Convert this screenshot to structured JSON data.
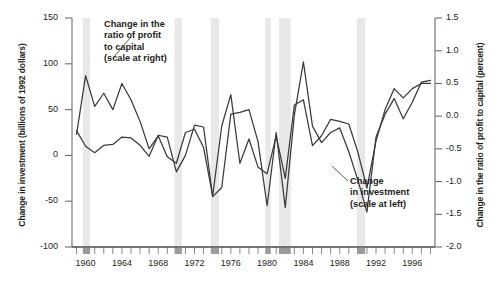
{
  "chart_data": {
    "type": "line",
    "title": "",
    "xlabel": "",
    "ylabel": "Change in investment (billions of 1992 dollars)",
    "y2label": "Change in the ratio of profit to capital (percent)",
    "xlim": [
      1958.5,
      1998.5
    ],
    "ylim": [
      -100,
      150
    ],
    "y2lim": [
      -2.0,
      1.5
    ],
    "grid": false,
    "legend": "annotations-inline",
    "yticks": [
      150,
      100,
      50,
      0,
      -50,
      -100
    ],
    "yticklabels": [
      "150",
      "100",
      "50",
      "0",
      "-50",
      "-100"
    ],
    "y2ticks": [
      1.5,
      1.0,
      0.5,
      0.0,
      -0.5,
      -1.0,
      -1.5,
      -2.0
    ],
    "y2ticklabels": [
      "1.5",
      "1.0",
      "0.5",
      "0.0",
      "-0.5",
      "-1.0",
      "-1.5",
      "-2.0"
    ],
    "xticks": [
      1960,
      1964,
      1968,
      1972,
      1976,
      1980,
      1984,
      1988,
      1992,
      1996
    ],
    "xticklabels": [
      "1960",
      "1964",
      "1968",
      "1972",
      "1976",
      "1980",
      "1984",
      "1988",
      "1992",
      "1996"
    ],
    "xminorticks": [
      1959,
      1960,
      1961,
      1962,
      1963,
      1964,
      1965,
      1966,
      1967,
      1968,
      1969,
      1970,
      1971,
      1972,
      1973,
      1974,
      1975,
      1976,
      1977,
      1978,
      1979,
      1980,
      1981,
      1982,
      1983,
      1984,
      1985,
      1986,
      1987,
      1988,
      1989,
      1990,
      1991,
      1992,
      1993,
      1994,
      1995,
      1996,
      1997,
      1998
    ],
    "x": [
      1959,
      1960,
      1961,
      1962,
      1963,
      1964,
      1965,
      1966,
      1967,
      1968,
      1969,
      1970,
      1971,
      1972,
      1973,
      1974,
      1975,
      1976,
      1977,
      1978,
      1979,
      1980,
      1981,
      1982,
      1983,
      1984,
      1985,
      1986,
      1987,
      1988,
      1989,
      1990,
      1991,
      1992,
      1993,
      1994,
      1995,
      1996,
      1997,
      1998
    ],
    "series": [
      {
        "name": "Change in investment (scale at left)",
        "axis": "left",
        "units": "billions of 1992 dollars",
        "color": "#3a3a3a",
        "values": [
          27,
          10,
          3,
          11,
          12,
          20,
          19,
          11,
          -1,
          22,
          20,
          -18,
          0,
          33,
          31,
          -45,
          -35,
          45,
          47,
          50,
          15,
          -55,
          25,
          -57,
          44,
          102,
          32,
          14,
          25,
          30,
          4,
          -27,
          -62,
          20,
          45,
          62,
          40,
          58,
          80,
          82
        ]
      },
      {
        "name": "Change in the ratio of profit to capital (scale at right)",
        "axis": "right",
        "units": "percent",
        "color": "#3a3a3a",
        "values": [
          -0.28,
          0.62,
          0.15,
          0.35,
          0.1,
          0.5,
          0.25,
          -0.08,
          -0.5,
          -0.3,
          -0.62,
          -0.72,
          -0.25,
          -0.2,
          -0.48,
          -1.22,
          -0.15,
          0.33,
          -0.72,
          -0.35,
          -0.78,
          -0.88,
          -0.3,
          -0.95,
          0.17,
          0.25,
          -0.45,
          -0.3,
          -0.05,
          -0.08,
          -0.12,
          -0.55,
          -1.1,
          -0.38,
          0.1,
          0.42,
          0.28,
          0.42,
          0.5,
          0.5
        ]
      }
    ],
    "recession_bands": [
      {
        "start": 1959.7,
        "end": 1960.5
      },
      {
        "start": 1969.8,
        "end": 1970.6
      },
      {
        "start": 1973.8,
        "end": 1974.7
      },
      {
        "start": 1979.8,
        "end": 1980.4
      },
      {
        "start": 1981.3,
        "end": 1982.6
      },
      {
        "start": 1989.9,
        "end": 1990.8
      }
    ],
    "annotations": [
      {
        "id": "profit-series-annotation",
        "lines": [
          "Change in the",
          "ratio of profit",
          "to capital",
          "(scale at right)"
        ],
        "leader_from": [
          113,
          58
        ],
        "leader_to": [
          131,
          37
        ]
      },
      {
        "id": "investment-series-annotation",
        "lines": [
          "Change",
          "in investment",
          "(scale at left)"
        ],
        "leader_from": [
          348,
          181
        ],
        "leader_to": [
          332,
          166
        ]
      }
    ]
  },
  "axes": {
    "left_title": "Change in investment (billions of 1992 dollars)",
    "right_title": "Change in the ratio of profit to capital (percent)"
  }
}
